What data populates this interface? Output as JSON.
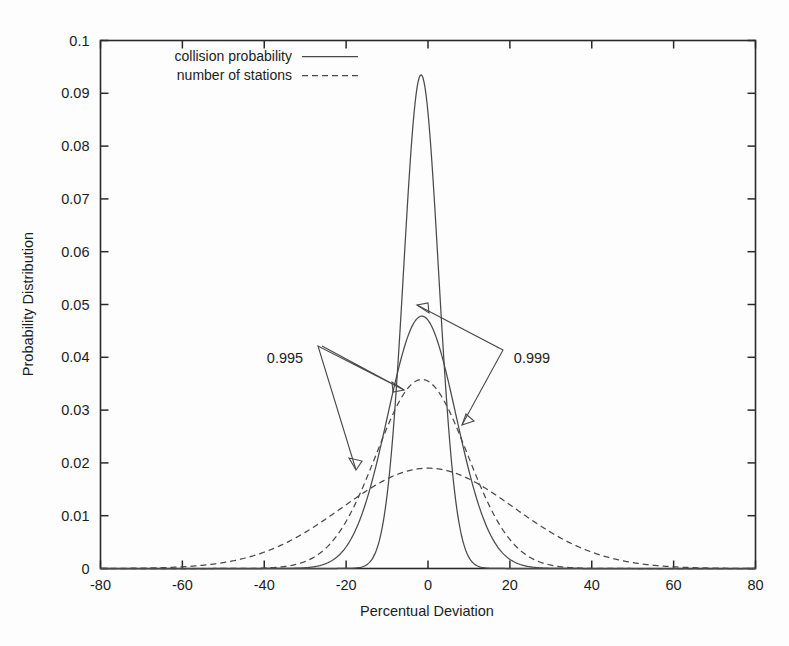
{
  "chart_data": {
    "type": "line",
    "title": "",
    "xlabel": "Percentual Deviation",
    "ylabel": "Probability Distribution",
    "xlim": [
      -80,
      80
    ],
    "ylim": [
      0,
      0.1
    ],
    "grid": false,
    "legend_position": "top-center",
    "xticks": [
      "-80",
      "-60",
      "-40",
      "-20",
      "0",
      "20",
      "40",
      "60",
      "80"
    ],
    "xtick_values": [
      -80,
      -60,
      -40,
      -20,
      0,
      20,
      40,
      60,
      80
    ],
    "yticks": [
      "0",
      "0.01",
      "0.02",
      "0.03",
      "0.04",
      "0.05",
      "0.06",
      "0.07",
      "0.08",
      "0.09",
      "0.1"
    ],
    "ytick_values": [
      0,
      0.01,
      0.02,
      0.03,
      0.04,
      0.05,
      0.06,
      0.07,
      0.08,
      0.09,
      0.1
    ],
    "legend": [
      {
        "label": "collision probability",
        "style": "solid"
      },
      {
        "label": "number of stations",
        "style": "dashed"
      }
    ],
    "annotations": [
      {
        "text": "0.995",
        "x": -34,
        "y": 0.0405
      },
      {
        "text": "0.999",
        "x": 21,
        "y": 0.0405
      }
    ],
    "series": [
      {
        "name": "collision probability 0.999",
        "style": "solid",
        "peak_x": -1.7,
        "peak_y": 0.0935,
        "sigma": 4.25,
        "annotation": "0.999"
      },
      {
        "name": "collision probability 0.995",
        "style": "solid",
        "peak_x": -1.5,
        "peak_y": 0.0478,
        "sigma": 8.35,
        "annotation": "0.995"
      },
      {
        "name": "number of stations 0.999",
        "style": "dashed",
        "peak_x": -1.5,
        "peak_y": 0.0358,
        "sigma": 11.1,
        "annotation": "0.999"
      },
      {
        "name": "number of stations 0.995",
        "style": "dashed",
        "peak_x": 0.0,
        "peak_y": 0.019,
        "sigma": 21.0,
        "annotation": "0.995"
      }
    ]
  }
}
